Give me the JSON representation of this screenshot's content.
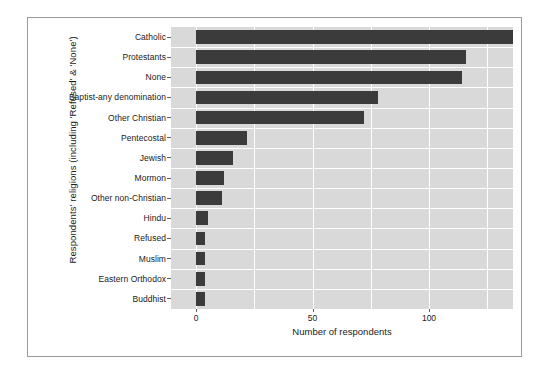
{
  "chart_data": {
    "type": "bar",
    "orientation": "horizontal",
    "title": "",
    "xlabel": "Number of respondents",
    "ylabel": "Respondents' religions (including 'Refused' & 'None')",
    "categories": [
      "Catholic",
      "Protestants",
      "None",
      "Baptist-any denomination",
      "Other Christian",
      "Pentecostal",
      "Jewish",
      "Mormon",
      "Other non-Christian",
      "Hindu",
      "Refused",
      "Muslim",
      "Eastern Orthodox",
      "Buddhist"
    ],
    "values": [
      141,
      116,
      114,
      78,
      72,
      22,
      16,
      12,
      11,
      5,
      4,
      4,
      4,
      4
    ],
    "xlim": [
      -3,
      144
    ],
    "xticks": [
      0,
      50,
      100
    ],
    "xtick_labels": [
      "0",
      "50",
      "100"
    ],
    "gridlines_x": [
      0,
      25,
      50,
      75,
      100,
      125
    ],
    "grid": true,
    "legend": "none",
    "panel_background": "#d9d9d9",
    "grid_color": "#ffffff",
    "bar_color": "#3b3b3b",
    "frame_color": "#9a9a9a"
  }
}
